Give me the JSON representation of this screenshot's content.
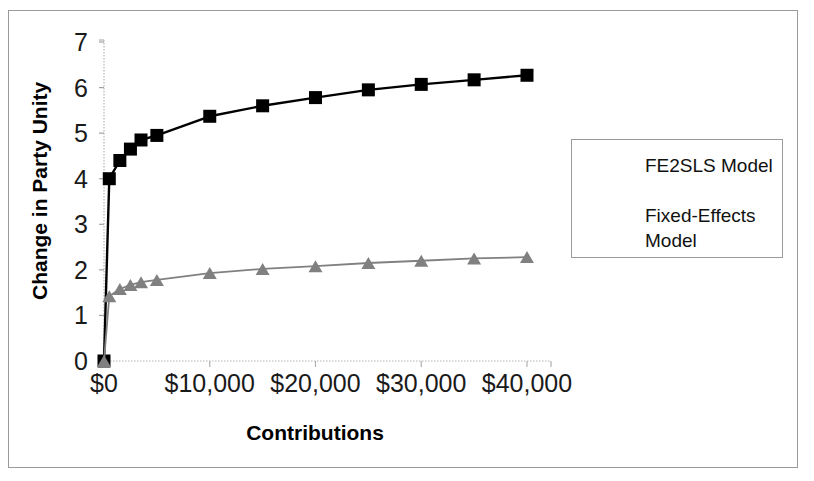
{
  "chart_data": {
    "type": "line",
    "title": "",
    "xlabel": "Contributions",
    "ylabel": "Change in Party Unity",
    "xlim": [
      0,
      42500
    ],
    "ylim": [
      0,
      7
    ],
    "grid": false,
    "legend_position": "right",
    "x_tick_labels": [
      "$0",
      "$10,000",
      "$20,000",
      "$30,000",
      "$40,000"
    ],
    "x_tick_values": [
      0,
      10000,
      20000,
      30000,
      40000
    ],
    "y_tick_labels": [
      "0",
      "1",
      "2",
      "3",
      "4",
      "5",
      "6",
      "7"
    ],
    "y_tick_values": [
      0,
      1,
      2,
      3,
      4,
      5,
      6,
      7
    ],
    "x": [
      0,
      500,
      1500,
      2500,
      3500,
      5000,
      10000,
      15000,
      20000,
      25000,
      30000,
      35000,
      40000
    ],
    "series": [
      {
        "name": "FE2SLS Model",
        "marker": "square",
        "color": "#000000",
        "values": [
          0,
          4.0,
          4.4,
          4.65,
          4.85,
          4.95,
          5.37,
          5.6,
          5.78,
          5.95,
          6.07,
          6.17,
          6.27
        ]
      },
      {
        "name": "Fixed-Effects Model",
        "marker": "triangle",
        "color": "#808080",
        "values": [
          0,
          1.42,
          1.58,
          1.67,
          1.73,
          1.78,
          1.93,
          2.02,
          2.08,
          2.15,
          2.2,
          2.25,
          2.28
        ]
      }
    ]
  },
  "legend": {
    "entries": [
      {
        "label": "FE2SLS Model"
      },
      {
        "label": "Fixed-Effects Model"
      }
    ]
  }
}
